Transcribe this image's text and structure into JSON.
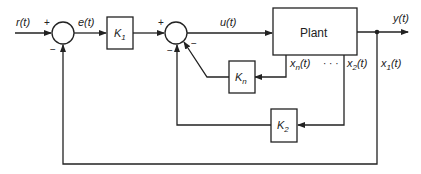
{
  "diagram": {
    "type": "state-feedback control block diagram",
    "signals": {
      "reference": "r(t)",
      "error": "e(t)",
      "control": "u(t)",
      "output": "y(t)",
      "state_1": "x",
      "state_1_sub": "1",
      "state_2": "x",
      "state_2_sub": "2",
      "state_n": "x",
      "state_n_sub": "n",
      "time_arg": "(t)",
      "ellipsis": "· · ·"
    },
    "blocks": {
      "k1": {
        "name": "K",
        "sub": "1"
      },
      "kn": {
        "name": "K",
        "sub": "n"
      },
      "k2": {
        "name": "K",
        "sub": "2"
      },
      "plant": {
        "name": "Plant"
      }
    },
    "summers": {
      "s1": {
        "plus": "+",
        "minus": "−"
      },
      "s2": {
        "plus": "+",
        "minus_bottom": "−",
        "minus_right": "−"
      }
    },
    "colors": {
      "line": "#222222",
      "background": "#ffffff"
    }
  }
}
